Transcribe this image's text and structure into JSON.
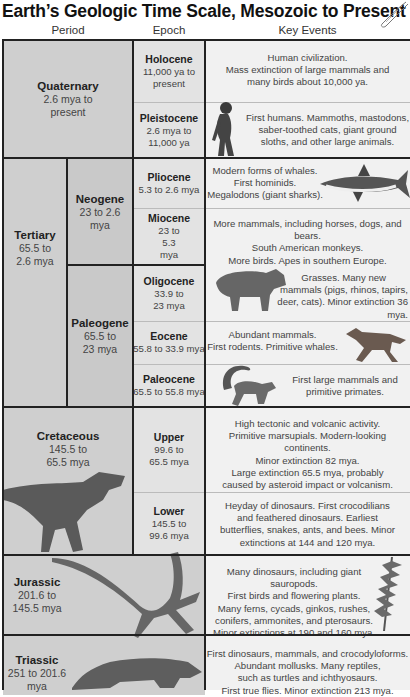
{
  "title": "Earth’s Geologic Time Scale, Mesozoic to Present",
  "columns": {
    "period": "Period",
    "epoch": "Epoch",
    "events": "Key Events"
  },
  "periods": {
    "quaternary": {
      "name": "Quaternary",
      "dates": "2.6 mya to present"
    },
    "tertiary": {
      "name": "Tertiary",
      "dates": "65.5 to 2.6 mya"
    },
    "neogene": {
      "name": "Neogene",
      "dates": "23 to 2.6 mya"
    },
    "paleogene": {
      "name": "Paleogene",
      "dates": "65.5 to 23 mya"
    },
    "cretaceous": {
      "name": "Cretaceous",
      "dates": "145.5 to 65.5 mya"
    },
    "jurassic": {
      "name": "Jurassic",
      "dates": "201.6 to 145.5 mya"
    },
    "triassic": {
      "name": "Triassic",
      "dates": "251 to 201.6 mya"
    }
  },
  "epochs": {
    "holocene": {
      "name": "Holocene",
      "dates": "11,000 ya to present",
      "events": [
        "Human civilization.",
        "Mass extinction of large mammals and",
        "many birds about 10,000 ya."
      ]
    },
    "pleistocene": {
      "name": "Pleistocene",
      "dates": "2.6 mya to 11,000 ya",
      "events": [
        "First humans. Mammoths, mastodons,",
        "saber-toothed cats, giant ground",
        "sloths, and other large animals."
      ]
    },
    "pliocene": {
      "name": "Pliocene",
      "dates": "5.3 to 2.6 mya",
      "events": [
        "Modern forms of whales.",
        "First hominids.",
        "Megalodons (giant sharks)."
      ]
    },
    "miocene": {
      "name": "Miocene",
      "dates": "23 to 5.3 mya",
      "events": [
        "More mammals, including horses, dogs, and bears.",
        "South American monkeys.",
        "More birds. Apes in southern Europe."
      ]
    },
    "oligocene": {
      "name": "Oligocene",
      "dates": "33.9 to 23 mya",
      "events": [
        "Grasses. Many new",
        "mammals (pigs, rhinos, tapirs,",
        "deer, cats). Minor extinction 36 mya."
      ]
    },
    "eocene": {
      "name": "Eocene",
      "dates": "55.8 to 33.9 mya",
      "events": [
        "Abundant mammals.",
        "First rodents. Primitive whales."
      ]
    },
    "paleocene": {
      "name": "Paleocene",
      "dates": "65.5 to 55.8 mya",
      "events": [
        "First large mammals and",
        "primitive primates."
      ]
    },
    "upper": {
      "name": "Upper",
      "dates": "99.6 to 65.5 mya",
      "events": [
        "High tectonic and volcanic activity.",
        "Primitive marsupials. Modern-looking continents.",
        "Minor extinction 82 mya.",
        "Large extinction 65.5 mya, probably",
        "caused by asteroid impact or volcanism."
      ]
    },
    "lower": {
      "name": "Lower",
      "dates": "145.5 to 99.6 mya",
      "events": [
        "Heyday of dinosaurs. First crocodilians",
        "and feathered dinosaurs. Earliest",
        "butterflies, snakes, ants, and bees. Minor",
        "extinctions at 144 and 120 mya."
      ]
    }
  },
  "period_events": {
    "jurassic": [
      "Many dinosaurs, including giant sauropods.",
      "First birds and flowering plants.",
      "Many ferns, cycads, ginkos, rushes,",
      "conifers, ammonites, and pterosaurs.",
      "Minor extinctions at 190 and 160 mya."
    ],
    "triassic": [
      "First dinosaurs, mammals, and crocodyloforms.",
      "Abundant mollusks. Many reptiles,",
      "such as turtles and ichthyosaurs.",
      "First true flies. Minor extinction 213 mya."
    ]
  }
}
